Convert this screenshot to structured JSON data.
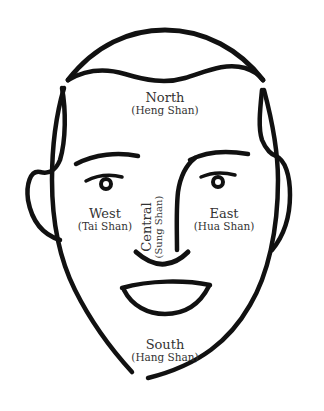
{
  "diagram": {
    "type": "face-map",
    "stroke_color": "#111111",
    "text_color": "#333333",
    "background": "#ffffff",
    "regions": {
      "north": {
        "label": "North",
        "mountain": "(Heng Shan)",
        "position": "forehead"
      },
      "west": {
        "label": "West",
        "mountain": "(Tai Shan)",
        "position": "left cheek"
      },
      "central": {
        "label": "Central",
        "mountain": "(Sung Shan)",
        "position": "nose",
        "orientation": "vertical"
      },
      "east": {
        "label": "East",
        "mountain": "(Hua Shan)",
        "position": "right cheek"
      },
      "south": {
        "label": "South",
        "mountain": "(Hang Shan)",
        "position": "chin"
      }
    },
    "features": [
      "head-outline",
      "hairline",
      "left-ear",
      "right-ear",
      "left-eyebrow",
      "right-eyebrow",
      "left-eye",
      "right-eye",
      "nose",
      "mouth",
      "chin"
    ]
  }
}
